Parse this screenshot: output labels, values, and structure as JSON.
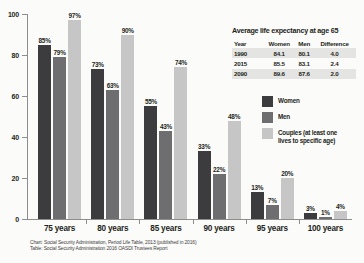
{
  "chart_data": {
    "type": "bar",
    "title": "",
    "xlabel": "",
    "ylabel": "",
    "ylim": [
      0,
      100
    ],
    "yticks": [
      0,
      20,
      40,
      60,
      80,
      100
    ],
    "grid": false,
    "legend_position": "right",
    "categories": [
      "75 years",
      "80 years",
      "85 years",
      "90 years",
      "95 years",
      "100 years"
    ],
    "series": [
      {
        "name": "Women",
        "color": "#3c3c3e",
        "values": [
          85,
          73,
          55,
          33,
          13,
          3
        ],
        "labels": [
          "85%",
          "73%",
          "55%",
          "33%",
          "13%",
          "3%"
        ]
      },
      {
        "name": "Men",
        "color": "#6e6e71",
        "values": [
          79,
          63,
          43,
          22,
          7,
          1
        ],
        "labels": [
          "79%",
          "63%",
          "43%",
          "22%",
          "7%",
          "1%"
        ]
      },
      {
        "name": "Couples (at least one lives to specific age)",
        "color": "#c6c6c6",
        "values": [
          97,
          90,
          74,
          48,
          20,
          4
        ],
        "labels": [
          "97%",
          "90%",
          "74%",
          "48%",
          "20%",
          "4%"
        ]
      }
    ]
  },
  "axis": {
    "ytick_labels": [
      "100",
      "80",
      "60",
      "40",
      "20",
      "0"
    ]
  },
  "legend": {
    "items": [
      {
        "label": "Women",
        "color": "#3c3c3e"
      },
      {
        "label": "Men",
        "color": "#6e6e71"
      },
      {
        "label": "Couples (at least one\nlives to specific age)",
        "color": "#c6c6c6"
      }
    ]
  },
  "table": {
    "title": "Average life expectancy at age 65",
    "headers": [
      "Year",
      "Women",
      "Men",
      "Difference"
    ],
    "rows": [
      [
        "1990",
        "84.1",
        "80.1",
        "4.0"
      ],
      [
        "2015",
        "85.5",
        "83.1",
        "2.4"
      ],
      [
        "2090",
        "89.6",
        "87.6",
        "2.0"
      ]
    ]
  },
  "notes": {
    "line1": "Chart: Social Security Administration, Period Life Table, 2013 (published in 2016)",
    "line2": "Table: Social Security Administration 2016 OASDI Trustees Report"
  }
}
